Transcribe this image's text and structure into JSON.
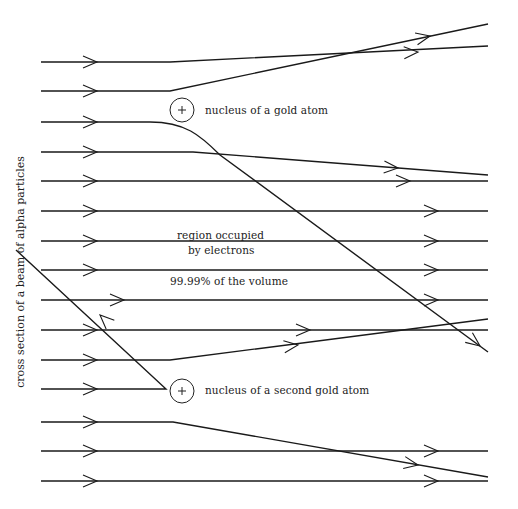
{
  "diagram": {
    "labels": {
      "nucleus_1": "nucleus of a gold atom",
      "nucleus_2": "nucleus of a second gold atom",
      "region_line1": "region occupied",
      "region_line2": "by electrons",
      "volume": "99.99% of the volume",
      "axis": "cross section of a beam of alpha particles"
    },
    "nuclei": [
      {
        "id": "nucleus-1",
        "cx": 182,
        "cy": 110,
        "r": 12,
        "symbol": "+"
      },
      {
        "id": "nucleus-2",
        "cx": 182,
        "cy": 391,
        "r": 12,
        "symbol": "+"
      }
    ],
    "beam": {
      "x_start": 41,
      "x_end": 488,
      "count": 15,
      "rows_y": [
        62,
        91,
        122,
        152,
        181,
        211,
        241,
        270,
        300,
        330,
        360,
        389,
        422,
        451,
        481
      ]
    },
    "trajectories": [
      {
        "row": 1,
        "d": "M41,62 L170,62 L488,46",
        "arrows": [
          [
            97,
            62,
            0
          ],
          [
            418,
            52,
            -3
          ]
        ]
      },
      {
        "row": 2,
        "d": "M41,91 L170,91 L488,24",
        "arrows": [
          [
            97,
            91,
            0
          ],
          [
            430,
            36,
            -12
          ]
        ]
      },
      {
        "row": 3,
        "d": "M41,122 L150,122 C185,122 200,135 220,155 L488,352",
        "arrows": [
          [
            97,
            122,
            0
          ],
          [
            480,
            346,
            37
          ]
        ]
      },
      {
        "row": 4,
        "d": "M41,152 L193,152 L488,175",
        "arrows": [
          [
            97,
            152,
            0
          ],
          [
            398,
            168,
            4
          ]
        ]
      },
      {
        "row": 5,
        "d": "M41,181 L488,181",
        "arrows": [
          [
            97,
            181,
            0
          ],
          [
            410,
            181,
            0
          ]
        ]
      },
      {
        "row": 6,
        "d": "M41,211 L488,211",
        "arrows": [
          [
            97,
            211,
            0
          ],
          [
            438,
            211,
            0
          ]
        ]
      },
      {
        "row": 7,
        "d": "M41,241 L488,241",
        "arrows": [
          [
            97,
            241,
            0
          ],
          [
            438,
            241,
            0
          ]
        ]
      },
      {
        "row": 8,
        "d": "M41,270 L488,270",
        "arrows": [
          [
            97,
            270,
            0
          ],
          [
            438,
            270,
            0
          ]
        ]
      },
      {
        "row": 9,
        "d": "M41,300 L488,300",
        "arrows": [
          [
            124,
            300,
            0
          ],
          [
            438,
            300,
            0
          ]
        ]
      },
      {
        "row": 10,
        "d": "M41,330 L488,330",
        "arrows": [
          [
            97,
            330,
            0
          ],
          [
            310,
            330,
            0
          ]
        ]
      },
      {
        "row": 11,
        "d": "M41,360 L170,360 L488,319",
        "arrows": [
          [
            97,
            360,
            0
          ],
          [
            298,
            345,
            -7
          ]
        ]
      },
      {
        "row": 12,
        "d": "M41,389 L166,389 L16,250",
        "arrows": [
          [
            97,
            389,
            0
          ],
          [
            100,
            315,
            223
          ]
        ]
      },
      {
        "row": 13,
        "d": "M41,422 L173,422 L488,477",
        "arrows": [
          [
            97,
            422,
            0
          ],
          [
            418,
            465,
            10
          ]
        ]
      },
      {
        "row": 14,
        "d": "M41,451 L488,451",
        "arrows": [
          [
            97,
            451,
            0
          ],
          [
            438,
            451,
            0
          ]
        ]
      },
      {
        "row": 15,
        "d": "M41,481 L488,481",
        "arrows": [
          [
            97,
            481,
            0
          ],
          [
            438,
            481,
            0
          ]
        ]
      }
    ]
  }
}
